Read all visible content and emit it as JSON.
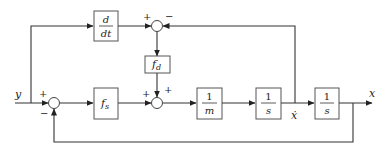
{
  "diagram": {
    "type": "block-diagram",
    "signals": {
      "input": "y",
      "output": "x",
      "velocity": "ẋ"
    },
    "blocks": {
      "derivative": {
        "num": "d",
        "den": "dt"
      },
      "fs": {
        "main": "f",
        "sub": "s"
      },
      "fd": {
        "main": "f",
        "sub": "d"
      },
      "inv_mass": {
        "num": "1",
        "den": "m"
      },
      "integrator1": {
        "num": "1",
        "den": "s"
      },
      "integrator2": {
        "num": "1",
        "den": "s"
      }
    },
    "summing_junctions": {
      "sum_top": {
        "signs": [
          "+",
          "−"
        ]
      },
      "sum_input": {
        "signs": [
          "+",
          "−"
        ]
      },
      "sum_mid": {
        "signs": [
          "+",
          "+"
        ]
      }
    }
  }
}
